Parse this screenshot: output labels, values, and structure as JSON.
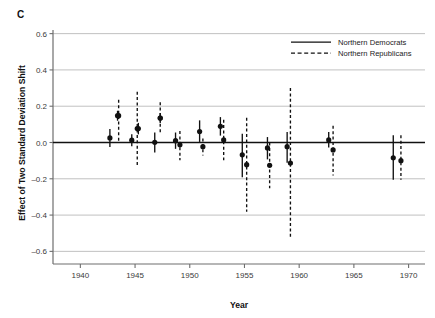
{
  "figure": {
    "panel_label": "C",
    "xlabel": "Year",
    "ylabel": "Effect of Two Standard Deviation Shift"
  },
  "legend": {
    "position": "top-right",
    "entries": [
      {
        "label": "Northern Democrats",
        "style": "solid",
        "color": "#111111"
      },
      {
        "label": "Northern Republicans",
        "style": "dashed",
        "color": "#111111"
      }
    ]
  },
  "chart_data": {
    "type": "scatter",
    "title": "",
    "subtitle": "",
    "xlabel": "Year",
    "ylabel": "Effect of Two Standard Deviation Shift",
    "xlim": [
      1937.5,
      1971.5
    ],
    "ylim": [
      -0.62,
      0.62
    ],
    "xticks": [
      1940,
      1945,
      1950,
      1955,
      1960,
      1965,
      1970
    ],
    "xtick_labels": [
      "1940",
      "1945",
      "1950",
      "1955",
      "1960",
      "1965",
      "1970"
    ],
    "yticks": [
      0.6,
      0.4,
      0.2,
      0.0,
      -0.2,
      -0.4,
      -0.6
    ],
    "ytick_labels": [
      "0.6",
      "0.4",
      "0.2",
      "0.0",
      "–0.2",
      "–0.4",
      "–0.6"
    ],
    "grid": "horizontal",
    "zero_line": 0.0,
    "marker": "filled-circle",
    "error_bar_note": "vertical confidence interval whiskers, no caps",
    "series": [
      {
        "name": "Northern Democrats",
        "style": "solid",
        "color": "#111111",
        "points": [
          {
            "x": 1942.7,
            "y": 0.025,
            "lo": -0.025,
            "hi": 0.075
          },
          {
            "x": 1943.4,
            "y": 0.148,
            "lo": 0.12,
            "hi": 0.175
          },
          {
            "x": 1944.7,
            "y": 0.013,
            "lo": -0.02,
            "hi": 0.045
          },
          {
            "x": 1945.3,
            "y": 0.077,
            "lo": 0.045,
            "hi": 0.108
          },
          {
            "x": 1946.8,
            "y": 0.001,
            "lo": -0.055,
            "hi": 0.055
          },
          {
            "x": 1947.3,
            "y": 0.135,
            "lo": 0.108,
            "hi": 0.162
          },
          {
            "x": 1948.7,
            "y": 0.01,
            "lo": -0.035,
            "hi": 0.055
          },
          {
            "x": 1950.9,
            "y": 0.06,
            "lo": 0.003,
            "hi": 0.122
          },
          {
            "x": 1952.8,
            "y": 0.089,
            "lo": 0.038,
            "hi": 0.14
          },
          {
            "x": 1954.8,
            "y": -0.068,
            "lo": -0.192,
            "hi": 0.048
          },
          {
            "x": 1957.1,
            "y": -0.03,
            "lo": -0.093,
            "hi": 0.03
          },
          {
            "x": 1958.9,
            "y": -0.023,
            "lo": -0.112,
            "hi": 0.058
          },
          {
            "x": 1962.7,
            "y": 0.014,
            "lo": -0.028,
            "hi": 0.058
          },
          {
            "x": 1968.6,
            "y": -0.084,
            "lo": -0.205,
            "hi": 0.04
          }
        ]
      },
      {
        "name": "Northern Republicans",
        "style": "dashed",
        "color": "#111111",
        "points": [
          {
            "x": 1943.5,
            "y": 0.148,
            "lo": 0.0,
            "hi": 0.235
          },
          {
            "x": 1945.2,
            "y": 0.077,
            "lo": -0.132,
            "hi": 0.28
          },
          {
            "x": 1947.3,
            "y": 0.135,
            "lo": 0.048,
            "hi": 0.222
          },
          {
            "x": 1949.1,
            "y": -0.013,
            "lo": -0.098,
            "hi": 0.063
          },
          {
            "x": 1951.2,
            "y": -0.023,
            "lo": -0.072,
            "hi": 0.022
          },
          {
            "x": 1953.1,
            "y": 0.014,
            "lo": -0.098,
            "hi": 0.126
          },
          {
            "x": 1955.2,
            "y": -0.122,
            "lo": -0.382,
            "hi": 0.136
          },
          {
            "x": 1957.3,
            "y": -0.126,
            "lo": -0.252,
            "hi": 0.0
          },
          {
            "x": 1959.2,
            "y": -0.113,
            "lo": -0.522,
            "hi": 0.3
          },
          {
            "x": 1963.1,
            "y": -0.041,
            "lo": -0.182,
            "hi": 0.092
          },
          {
            "x": 1969.3,
            "y": -0.1,
            "lo": -0.205,
            "hi": 0.04
          }
        ]
      }
    ]
  },
  "geometry": {
    "plot_left": 53,
    "plot_right": 425,
    "plot_top": 30,
    "plot_bottom": 255,
    "x_min": 1937.5,
    "x_max": 1971.5,
    "y_min": -0.62,
    "y_max": 0.62
  },
  "colors": {
    "background": "#ffffff",
    "ink": "#111111",
    "grid": "#b9b9b9",
    "axis": "#6e6e6e",
    "tick_text": "#3a3a3a"
  }
}
